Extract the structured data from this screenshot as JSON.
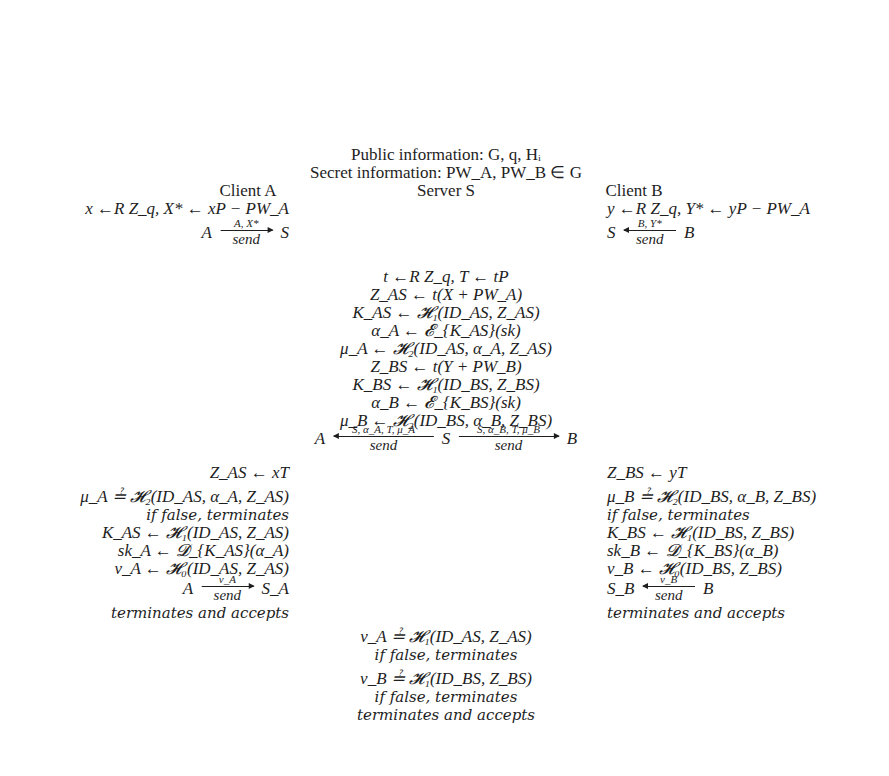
{
  "header": {
    "public_info": "Public information: G, q, Hᵢ",
    "secret_info": "Secret information: PW_A, PW_B ∈ G"
  },
  "parties": {
    "client_a": "Client A",
    "server": "Server S",
    "client_b": "Client B"
  },
  "client_a_init": {
    "step1": "x ←R Z_q, X* ← xP − PW_A",
    "msg": {
      "from": "A",
      "to": "S",
      "label": "A, X*",
      "sub": "send",
      "direction": "right"
    }
  },
  "client_b_init": {
    "step1": "y ←R Z_q, Y* ← yP − PW_A",
    "msg": {
      "from": "S",
      "to": "B",
      "label": "B, Y*",
      "sub": "send",
      "direction": "left"
    }
  },
  "server_steps": [
    "t ←R Z_q, T ← tP",
    "Z_AS ← t(X + PW_A)",
    "K_AS ← 𝓗₁(ID_AS, Z_AS)",
    "α_A ← 𝓔_{K_AS}(sk)",
    "μ_A ← 𝓗₂(ID_AS, α_A, Z_AS)",
    "Z_BS ← t(Y + PW_B)",
    "K_BS ← 𝓗₁(ID_BS, Z_BS)",
    "α_B ← 𝓔_{K_BS}(sk)",
    "μ_B ← 𝓗₂(ID_BS, α_B, Z_BS)"
  ],
  "server_msgs": {
    "left": {
      "party": "A",
      "label": "S, α_A, T, μ_A",
      "sub": "send"
    },
    "center": "S",
    "right": {
      "party": "B",
      "label": "S, α_B, T, μ_B",
      "sub": "send"
    }
  },
  "client_a_final": [
    "Z_AS ← xT",
    "μ_A ≟ 𝓗₂(ID_AS, α_A, Z_AS)",
    "if false, terminates",
    "K_AS ← 𝓗₁(ID_AS, Z_AS)",
    "sk_A ← 𝓓_{K_AS}(α_A)",
    "ν_A ← 𝓗₀(ID_AS, Z_AS)"
  ],
  "client_a_final_msg": {
    "from": "A",
    "to": "S_A",
    "label": "ν_A",
    "sub": "send"
  },
  "client_a_end": "terminates and accepts",
  "client_b_final": [
    "Z_BS ← yT",
    "μ_B ≟ 𝓗₂(ID_BS, α_B, Z_BS)",
    "if false, terminates",
    "K_BS ← 𝓗₁(ID_BS, Z_BS)",
    "sk_B ← 𝓓_{K_BS}(α_B)",
    "ν_B ← 𝓗₀(ID_BS, Z_BS)"
  ],
  "client_b_final_msg": {
    "from": "S_B",
    "to": "B",
    "label": "ν_B",
    "sub": "send"
  },
  "client_b_end": "terminates and accepts",
  "server_final": [
    "ν_A ≟ 𝓗₁(ID_AS, Z_AS)",
    "if false, terminates",
    "ν_B ≟ 𝓗₁(ID_BS, Z_BS)",
    "if false, terminates",
    "terminates and accepts"
  ]
}
